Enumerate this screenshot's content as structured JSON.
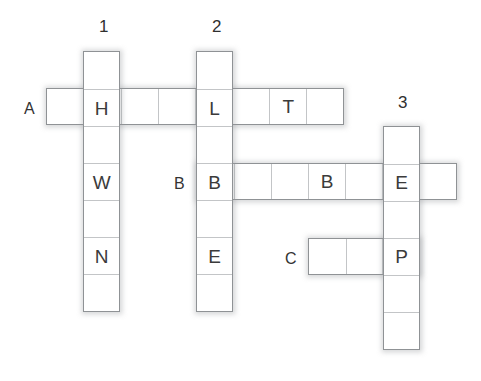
{
  "puzzle": {
    "type": "crossword",
    "cell_size": 37.3,
    "grid_origin": {
      "x": 46,
      "y": 88
    },
    "colors": {
      "background": "#ffffff",
      "cell_fill": "#ffffff",
      "cell_border": "#8f9295",
      "cell_divider": "#c3c5c7",
      "letter": "#3b3b3b",
      "label": "#333333"
    },
    "row_labels": [
      {
        "name": "row-label-a",
        "text": "A",
        "x": 24,
        "y": 101
      },
      {
        "name": "row-label-b",
        "text": "B",
        "x": 174,
        "y": 176
      },
      {
        "name": "row-label-c",
        "text": "C",
        "x": 285,
        "y": 251
      }
    ],
    "column_labels": [
      {
        "name": "column-label-1",
        "text": "1",
        "x": 99,
        "y": 18
      },
      {
        "name": "column-label-2",
        "text": "2",
        "x": 212,
        "y": 18
      },
      {
        "name": "column-label-3",
        "text": "3",
        "x": 398,
        "y": 94
      }
    ],
    "entries": [
      {
        "name": "entry-across-a",
        "clue": "A",
        "direction": "across",
        "length": 8,
        "x": 46,
        "y": 88,
        "letters": [
          "",
          "H",
          "",
          "",
          "L",
          "",
          "T",
          ""
        ]
      },
      {
        "name": "entry-across-b",
        "clue": "B",
        "direction": "across",
        "length": 7,
        "x": 196,
        "y": 163,
        "letters": [
          "B",
          "",
          "",
          "B",
          "",
          "E",
          ""
        ]
      },
      {
        "name": "entry-across-c",
        "clue": "C",
        "direction": "across",
        "length": 3,
        "x": 308,
        "y": 238,
        "letters": [
          "",
          "",
          "P"
        ]
      },
      {
        "name": "entry-down-1",
        "clue": "1",
        "direction": "down",
        "length": 7,
        "x": 83,
        "y": 51,
        "letters": [
          "",
          "H",
          "",
          "W",
          "",
          "N",
          ""
        ]
      },
      {
        "name": "entry-down-2",
        "clue": "2",
        "direction": "down",
        "length": 7,
        "x": 196,
        "y": 51,
        "letters": [
          "",
          "L",
          "",
          "B",
          "",
          "E",
          ""
        ]
      },
      {
        "name": "entry-down-3",
        "clue": "3",
        "direction": "down",
        "length": 6,
        "x": 383,
        "y": 126,
        "letters": [
          "",
          "E",
          "",
          "P",
          "",
          ""
        ]
      }
    ]
  }
}
